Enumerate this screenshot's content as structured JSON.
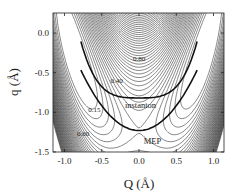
{
  "chart_data": {
    "type": "contour",
    "title": "",
    "xlabel": "Q (Å)",
    "ylabel": "q (Å)",
    "xlim": [
      -1.2,
      1.15
    ],
    "ylim": [
      -1.5,
      0.25
    ],
    "xticks": [
      -1.0,
      -0.5,
      0.0,
      0.5,
      1.0
    ],
    "xtick_labels": [
      "-1.0",
      "-0.5",
      "0.0",
      "0.5",
      "1.0"
    ],
    "yticks": [
      0.0,
      -0.5,
      -1.0,
      -1.5
    ],
    "ytick_labels": [
      "0.0",
      "-0.5",
      "-1.0",
      "-1.5"
    ],
    "grid": false,
    "legend": "none",
    "contour_labels": [
      {
        "text": "0.80",
        "x": 0.0,
        "y": -0.35
      },
      {
        "text": "0.40",
        "x": -0.3,
        "y": -0.63
      },
      {
        "text": "0.15",
        "x": -0.6,
        "y": -1.0
      },
      {
        "text": "0.60",
        "x": -0.75,
        "y": -1.3
      }
    ],
    "curves": [
      {
        "name": "instanton",
        "label": "instanton",
        "description": "shallow U-shaped tunneling path",
        "points": [
          [
            -0.75,
            -0.2
          ],
          [
            -0.5,
            -0.6
          ],
          [
            -0.3,
            -0.76
          ],
          [
            0.0,
            -0.82
          ],
          [
            0.3,
            -0.76
          ],
          [
            0.5,
            -0.6
          ],
          [
            0.75,
            -0.2
          ]
        ]
      },
      {
        "name": "MEP",
        "label": "MEP",
        "description": "minimum energy path, deeper U through saddle",
        "points": [
          [
            -0.75,
            -0.55
          ],
          [
            -0.5,
            -0.9
          ],
          [
            -0.25,
            -1.15
          ],
          [
            0.0,
            -1.23
          ],
          [
            0.25,
            -1.15
          ],
          [
            0.5,
            -0.9
          ],
          [
            0.75,
            -0.55
          ]
        ]
      }
    ],
    "saddle_point": {
      "x": 0.0,
      "y": -1.23
    }
  }
}
